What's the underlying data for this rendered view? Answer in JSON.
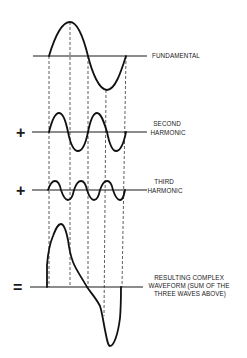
{
  "diagram": {
    "rows": [
      {
        "id": "fundamental",
        "operator": "",
        "label_lines": [
          "FUNDAMENTAL"
        ]
      },
      {
        "id": "second-harmonic",
        "operator": "+",
        "label_lines": [
          "SECOND",
          "HARMONIC"
        ]
      },
      {
        "id": "third-harmonic",
        "operator": "+",
        "label_lines": [
          "THIRD",
          "HARMONIC"
        ]
      },
      {
        "id": "result",
        "operator": "=",
        "label_lines": [
          "RESULTING COMPLEX",
          "WAVEFORM (SUM OF THE",
          "THREE WAVES ABOVE)"
        ]
      }
    ],
    "colors": {
      "ink": "#111111",
      "background": "#ffffff"
    }
  }
}
